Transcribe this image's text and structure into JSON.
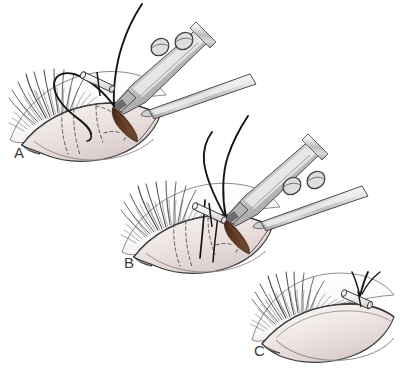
{
  "figure": {
    "background_color": "#ffffff",
    "width": 400,
    "height": 370
  },
  "palette": {
    "outline": "#3b3b3b",
    "lid_fill_light": "#f2ecea",
    "lid_fill_mid": "#e3d7d5",
    "lid_fill_shadow": "#cbbcba",
    "wound_brown": "#5c3a26",
    "wound_brown_dark": "#3e2416",
    "instrument_light": "#f4f4f4",
    "instrument_mid": "#c9c9c9",
    "instrument_dark": "#8d8d8d",
    "suture_black": "#171717",
    "lash_gray": "#4a4a4a",
    "dashed_line": "#6b6b6b",
    "bolster_fill": "#ededed",
    "label_text": "#3a3a3a"
  },
  "panels": [
    {
      "id": "A",
      "label": "A",
      "label_x": 14,
      "label_y": 158,
      "caption": "Needle and suture passed through upper eyelid with forceps and retractor; wound edge exposed",
      "features": {
        "has_eyelashes": true,
        "has_dashed_markings": true,
        "has_wound": true,
        "has_suture_loop": true,
        "has_bolster": true,
        "has_forceps": true,
        "has_retractor": true,
        "suture_count": 1
      }
    },
    {
      "id": "B",
      "label": "B",
      "label_x": 124,
      "label_y": 268,
      "caption": "Second suture pass completed; both suture arms emerging from eyelid with bolster in place",
      "features": {
        "has_eyelashes": true,
        "has_dashed_markings": true,
        "has_wound": true,
        "has_suture_loop": false,
        "has_bolster": true,
        "has_forceps": true,
        "has_retractor": true,
        "suture_count": 2
      }
    },
    {
      "id": "C",
      "label": "C",
      "label_x": 254,
      "label_y": 356,
      "caption": "Final result: eyelid closed with suture tied over bolster on the skin surface",
      "features": {
        "has_eyelashes": true,
        "has_dashed_markings": false,
        "has_wound": false,
        "has_suture_loop": false,
        "has_bolster": true,
        "has_forceps": false,
        "has_retractor": false,
        "suture_count": 2
      }
    }
  ],
  "instruments": [
    {
      "name": "needle-holder-forceps",
      "panel": "A",
      "description": "Metal needle holder with two ring openings in the handle",
      "ring_count": 2
    },
    {
      "name": "flat-retractor",
      "panel": "A",
      "description": "Flat metal retractor blade entering from right"
    },
    {
      "name": "needle-holder-forceps",
      "panel": "B",
      "description": "Metal needle holder with two ring openings in the handle",
      "ring_count": 2
    },
    {
      "name": "flat-retractor",
      "panel": "B",
      "description": "Flat metal retractor blade entering from right"
    }
  ],
  "anatomy": {
    "structure": "upper eyelid and globe",
    "lash_row": "eyelashes along superior lid margin",
    "dashed_marking_label": "tarsal plate outline / planned incision"
  }
}
